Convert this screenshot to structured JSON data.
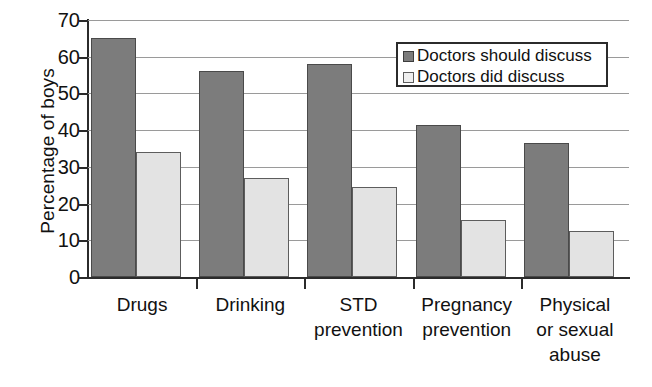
{
  "chart_data": {
    "type": "bar",
    "title": "",
    "subtitle": "",
    "xlabel": "",
    "ylabel": "Percentage of boys",
    "ylim": [
      0,
      70
    ],
    "ytick_step": 10,
    "yticks": [
      "0",
      "10",
      "20",
      "30",
      "40",
      "50",
      "60",
      "70"
    ],
    "grid": true,
    "legend_position": "top-right",
    "categories": [
      "Drugs",
      "Drinking",
      "STD prevention",
      "Pregnancy prevention",
      "Physical or sexual abuse"
    ],
    "category_label_lines": [
      [
        "Drugs"
      ],
      [
        "Drinking"
      ],
      [
        "STD",
        "prevention"
      ],
      [
        "Pregnancy",
        "prevention"
      ],
      [
        "Physical",
        "or sexual",
        "abuse"
      ]
    ],
    "series": [
      {
        "name": "Doctors should discuss",
        "color": "#7c7c7c",
        "values": [
          65,
          56,
          58,
          41.5,
          36.5
        ]
      },
      {
        "name": "Doctors did discuss",
        "color": "#e3e3e3",
        "values": [
          34,
          27,
          24.5,
          15.5,
          12.5
        ]
      }
    ]
  },
  "legend": {
    "items": [
      {
        "label": "Doctors should discuss",
        "swatch": "should"
      },
      {
        "label": "Doctors did discuss",
        "swatch": "did"
      }
    ]
  },
  "colors": {
    "series_should": "#7c7c7c",
    "series_did": "#e3e3e3",
    "axis": "#2b2b2b",
    "gridline": "#9a9a9a",
    "background": "#ffffff"
  }
}
